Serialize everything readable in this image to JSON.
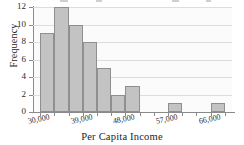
{
  "chart_data": {
    "type": "bar",
    "title": "",
    "xlabel": "Per Capita Income",
    "ylabel": "Frequency",
    "categories": [
      "30,000-33,000",
      "33,000-36,000",
      "36,000-39,000",
      "39,000-42,000",
      "42,000-45,000",
      "45,000-48,000",
      "48,000-51,000",
      "51,000-54,000",
      "54,000-57,000",
      "57,000-60,000",
      "60,000-63,000",
      "63,000-66,000",
      "66,000-69,000"
    ],
    "values": [
      9,
      12,
      10,
      8,
      5,
      2,
      3,
      0,
      0,
      1,
      0,
      0,
      1
    ],
    "bin_width": 3000,
    "bin_start": 30000,
    "xlim": [
      28500,
      70500
    ],
    "ylim": [
      0,
      12
    ],
    "ytick_labels": [
      "0",
      "2",
      "4",
      "6",
      "8",
      "10",
      "12"
    ],
    "ytick_values": [
      0,
      2,
      4,
      6,
      8,
      10,
      12
    ],
    "xtick_labels": [
      "30,000",
      "39,000",
      "48,000",
      "57,000",
      "66,000"
    ],
    "xtick_values": [
      30000,
      39000,
      48000,
      57000,
      66000
    ],
    "grid": true,
    "legend": null,
    "bar_color": "#c3c3c3",
    "bar_edge_color": "#8f8f8f",
    "axis_color": "#8a8a8a",
    "grid_color": "#dddddd",
    "background_color": "#fbfbfb"
  }
}
